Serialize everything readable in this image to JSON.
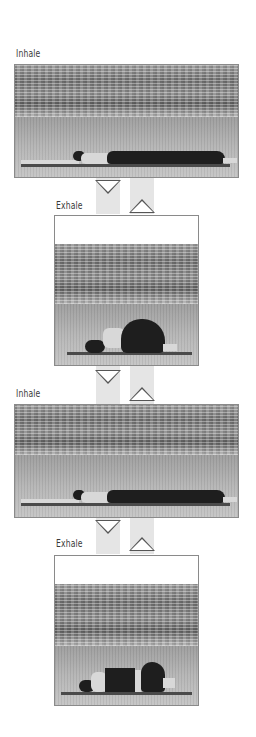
{
  "sequence": [
    {
      "label": "Inhale",
      "pose": "lying-flat-arms-overhead"
    },
    {
      "label": "Exhale",
      "pose": "knees-to-chest-curled"
    },
    {
      "label": "Inhale",
      "pose": "lying-flat-arms-overhead"
    },
    {
      "label": "Exhale",
      "pose": "knees-to-chest-curled"
    }
  ],
  "arrows": [
    {
      "direction": "down"
    },
    {
      "direction": "up"
    },
    {
      "direction": "down"
    },
    {
      "direction": "up"
    },
    {
      "direction": "down"
    },
    {
      "direction": "up"
    }
  ],
  "colors": {
    "frame_border": "#8a8a8a",
    "arrow_stroke": "#555555",
    "stripe": "#cfcfcf",
    "label_text": "#3a3a3a"
  }
}
